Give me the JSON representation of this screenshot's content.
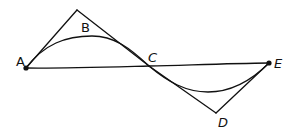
{
  "diagram": {
    "type": "geometric-path-comparison",
    "colors": {
      "stroke": "#111111",
      "background": "#ffffff"
    },
    "points": [
      {
        "id": "A",
        "label": "A",
        "x": 26,
        "y": 68,
        "dot": true,
        "label_x": 16,
        "label_y": 66
      },
      {
        "id": "B",
        "label": "B",
        "x": 77,
        "y": 10,
        "dot": false,
        "label_x": 81,
        "label_y": 32
      },
      {
        "id": "C",
        "label": "C",
        "x": 149,
        "y": 66,
        "dot": false,
        "label_x": 148,
        "label_y": 62
      },
      {
        "id": "D",
        "label": "D",
        "x": 216,
        "y": 113,
        "dot": false,
        "label_x": 218,
        "label_y": 127
      },
      {
        "id": "E",
        "label": "E",
        "x": 269,
        "y": 63,
        "dot": true,
        "label_x": 274,
        "label_y": 68
      }
    ],
    "segments": [
      {
        "id": "AB",
        "from": "A",
        "to": "B"
      },
      {
        "id": "BC",
        "from": "B",
        "to": "C"
      },
      {
        "id": "CD",
        "from": "C",
        "to": "D"
      },
      {
        "id": "DE",
        "from": "D",
        "to": "E"
      },
      {
        "id": "AE",
        "from": "A",
        "to": "E",
        "through": "C"
      }
    ],
    "curves": [
      {
        "id": "arc-AC",
        "from": "A",
        "to": "C",
        "bulge": "up"
      },
      {
        "id": "arc-CE",
        "from": "C",
        "to": "E",
        "bulge": "down"
      }
    ]
  }
}
